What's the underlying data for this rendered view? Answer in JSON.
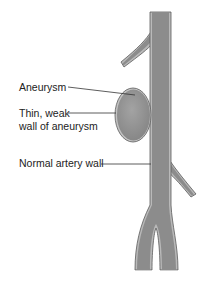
{
  "title": "",
  "labels": {
    "aneurysm": "Aneurysm",
    "thin_wall_line1": "Thin, weak",
    "thin_wall_line2": "wall of aneurysm",
    "normal_wall": "Normal artery wall"
  },
  "colors": {
    "vessel_fill": "#8c8c8c",
    "vessel_wall": "#b9b9b9",
    "vessel_outline": "#5a5a5a",
    "aneurysm_fill": "#9a9a9a",
    "leader_line": "#333333",
    "background": "#ffffff"
  }
}
